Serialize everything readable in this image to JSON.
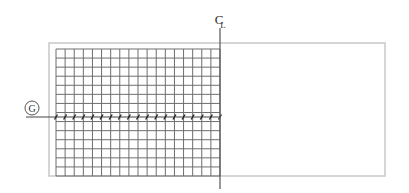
{
  "diagram": {
    "centerline_label_c": "C",
    "centerline_label_l": "L",
    "grid_marker_label": "G",
    "colors": {
      "outline": "#c8c8c8",
      "grid": "#6e6e6e",
      "centerline": "#555555",
      "gridline": "#444444",
      "text": "#333333"
    },
    "outer_rect": {
      "x": 49,
      "y": 43,
      "width": 336,
      "height": 133
    },
    "grid": {
      "x": 56,
      "y": 49,
      "width": 164,
      "height": 127,
      "columns": 18,
      "rows": 14
    },
    "centerline": {
      "x": 220,
      "y1": 28,
      "y2": 189
    },
    "grid_line": {
      "y": 117,
      "x1": 26,
      "x2": 220
    },
    "marker": {
      "cx": 32,
      "cy": 108,
      "r": 7
    }
  }
}
